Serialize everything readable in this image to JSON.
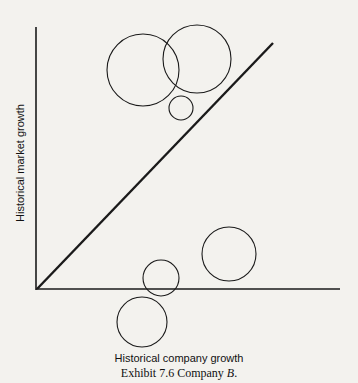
{
  "diagram": {
    "x_axis_label": "Historical company growth",
    "y_axis_label": "Historical market growth",
    "caption_prefix": "Exhibit 7.6 Company ",
    "caption_emph": "B",
    "caption_suffix": ".",
    "stroke_color": "#1a1a1a",
    "background": "#f3f2ee"
  },
  "chart_data": {
    "type": "scatter",
    "title": "Exhibit 7.6 Company B.",
    "xlabel": "Historical company growth",
    "ylabel": "Historical market growth",
    "reference_line": "diagonal (market growth = company growth)",
    "bubbles": [
      {
        "cx": 143,
        "cy": 70,
        "r": 36,
        "position": "above diagonal"
      },
      {
        "cx": 197,
        "cy": 59,
        "r": 34,
        "position": "above diagonal"
      },
      {
        "cx": 181,
        "cy": 108,
        "r": 12,
        "position": "above diagonal"
      },
      {
        "cx": 229,
        "cy": 254,
        "r": 27,
        "position": "below diagonal"
      },
      {
        "cx": 161,
        "cy": 278,
        "r": 18,
        "position": "below diagonal, on x-axis"
      },
      {
        "cx": 142,
        "cy": 322,
        "r": 25,
        "position": "below x-axis"
      }
    ]
  }
}
